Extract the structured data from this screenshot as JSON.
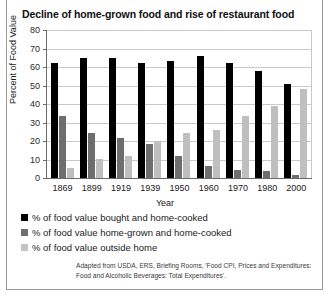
{
  "chart_data": {
    "type": "bar",
    "title": "Decline of home-grown food and rise of restaurant food",
    "xlabel": "Year",
    "ylabel": "Percent of Food Value",
    "categories": [
      "1869",
      "1899",
      "1919",
      "1939",
      "1950",
      "1960",
      "1970",
      "1980",
      "2000"
    ],
    "series": [
      {
        "name": "% of food value bought and home-cooked",
        "color": "#000000",
        "values": [
          62,
          65,
          65,
          62,
          63,
          66,
          62,
          58,
          51
        ]
      },
      {
        "name": "% of food value home-grown and home-cooked",
        "color": "#6e6e6e",
        "values": [
          33.5,
          24.5,
          21.5,
          18.5,
          12,
          6.5,
          4.5,
          4,
          1.5
        ]
      },
      {
        "name": "% of food value outside home",
        "color": "#bfbfbf",
        "values": [
          5.5,
          10,
          12,
          20,
          24.5,
          26,
          33.5,
          39,
          48
        ]
      }
    ],
    "ylim": [
      0,
      80
    ],
    "yticks": [
      0,
      10,
      20,
      30,
      40,
      50,
      60,
      70,
      80
    ],
    "grid": true,
    "legend_position": "below"
  },
  "legend": [
    {
      "label": "% of food value bought and home-cooked",
      "swatch": "s0"
    },
    {
      "label": "% of food value home-grown and home-cooked",
      "swatch": "s1"
    },
    {
      "label": "% of food value outside home",
      "swatch": "s2"
    }
  ],
  "source_note": "Adapted from USDA, ERS, Briefing Rooms, 'Food CPI, Prices and Expenditures: Food and Alcoholic Beverages: Total Expenditures'."
}
